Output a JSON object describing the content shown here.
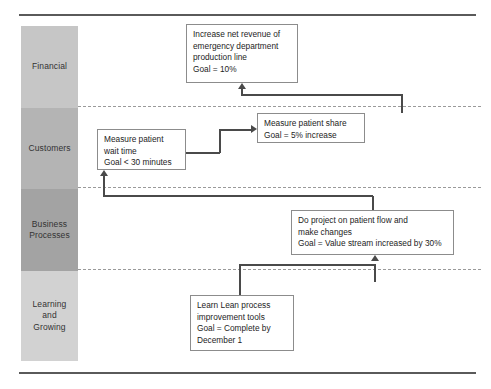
{
  "diagram": {
    "type": "strategy-map",
    "title": "",
    "frame": {
      "top_rule": true,
      "bottom_rule": true
    },
    "perspectives": [
      {
        "id": "financial",
        "label": "Financial",
        "lines": [
          "Financial"
        ],
        "color": "#c6c6c6",
        "top": 26,
        "height": 82
      },
      {
        "id": "customers",
        "label": "Customers",
        "lines": [
          "Customers"
        ],
        "color": "#b4b4b4",
        "top": 108,
        "height": 81
      },
      {
        "id": "business-processes",
        "label": "Business Processes",
        "lines": [
          "Business",
          "Processes"
        ],
        "color": "#a3a3a3",
        "top": 189,
        "height": 82
      },
      {
        "id": "learning-and-growing",
        "label": "Learning and Growing",
        "lines": [
          "Learning",
          "and",
          "Growing"
        ],
        "color": "#d2d2d2",
        "top": 271,
        "height": 90
      }
    ],
    "dividers": [
      {
        "id": "financial-customers",
        "top": 106
      },
      {
        "id": "customers-processes",
        "top": 187
      },
      {
        "id": "processes-learning",
        "top": 269
      }
    ],
    "objectives": [
      {
        "id": "increase-net-revenue",
        "perspective": "financial",
        "text": "Increase net revenue of\nemergency department\nproduction line\nGoal = 10%",
        "goal": "Goal = 10%",
        "left": 186,
        "top": 24,
        "width": 112,
        "height": 59
      },
      {
        "id": "measure-patient-wait-time",
        "perspective": "customers",
        "text": "Measure patient\nwait time\nGoal <  30 minutes",
        "goal": "Goal <  30 minutes",
        "left": 97,
        "top": 129,
        "width": 89,
        "height": 41
      },
      {
        "id": "measure-patient-share",
        "perspective": "customers",
        "text": "Measure patient share\nGoal = 5% increase",
        "goal": "Goal = 5% increase",
        "left": 257,
        "top": 113,
        "width": 108,
        "height": 30
      },
      {
        "id": "patient-flow-project",
        "perspective": "business-processes",
        "text": "Do project on patient flow and\nmake changes\nGoal = Value stream increased by 30%",
        "goal": "Goal = Value stream increased by 30%",
        "left": 291,
        "top": 210,
        "width": 163,
        "height": 45
      },
      {
        "id": "learn-lean-tools",
        "perspective": "learning-and-growing",
        "text": "Learn Lean process\nimprovement tools\nGoal = Complete by\nDecember 1",
        "goal": "Goal = Complete by December 1",
        "left": 190,
        "top": 295,
        "width": 104,
        "height": 56
      }
    ],
    "connectors": [
      {
        "id": "share-to-revenue",
        "from": "measure-patient-share",
        "to": "increase-net-revenue"
      },
      {
        "id": "wait-to-share",
        "from": "measure-patient-wait-time",
        "to": "measure-patient-share"
      },
      {
        "id": "flow-to-wait",
        "from": "patient-flow-project",
        "to": "measure-patient-wait-time"
      },
      {
        "id": "learn-to-flow",
        "from": "learn-lean-tools",
        "to": "patient-flow-project"
      }
    ]
  }
}
